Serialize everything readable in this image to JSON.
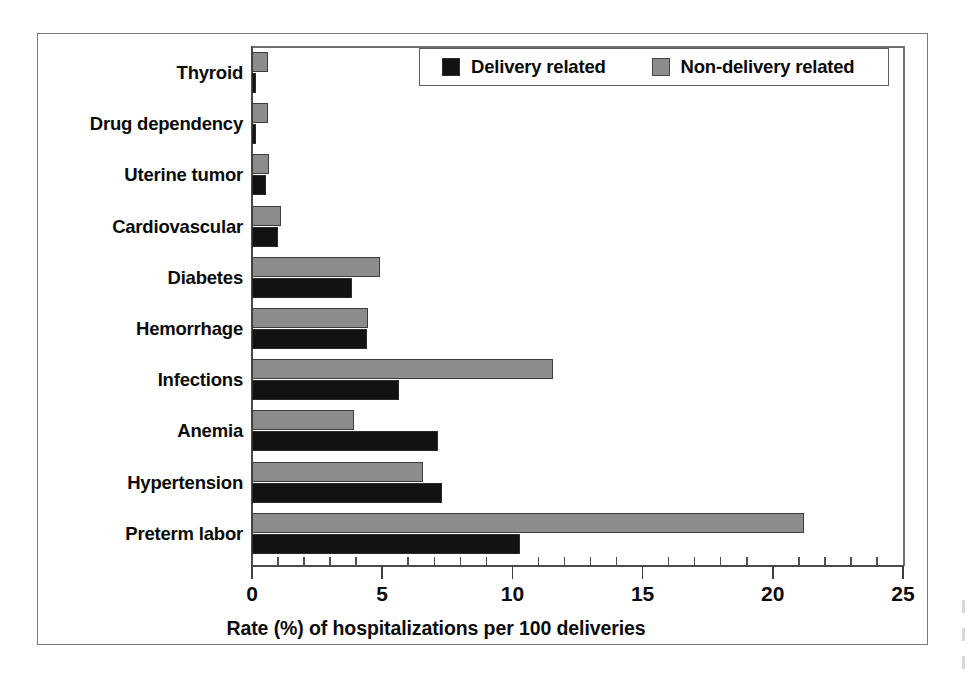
{
  "figure": {
    "title": "",
    "axis_label_x": "Rate (%) of hospitalizations per 100 deliveries"
  },
  "legend": {
    "items": [
      {
        "label": "Delivery related",
        "color": "#121212",
        "key": "delivery"
      },
      {
        "label": "Non-delivery related",
        "color": "#8c8c8c",
        "key": "non_delivery"
      }
    ]
  },
  "axis": {
    "x_ticks_major": [
      "0",
      "5",
      "10",
      "15",
      "20",
      "25"
    ],
    "x_min": 0,
    "x_max": 25,
    "x_minor_step": 1
  },
  "chart_data": {
    "type": "bar",
    "orientation": "horizontal",
    "title": "",
    "xlabel": "Rate (%) of hospitalizations per 100 deliveries",
    "ylabel": "",
    "xlim": [
      0,
      25
    ],
    "grid": false,
    "legend_position": "top-right-inside",
    "categories": [
      "Thyroid",
      "Drug dependency",
      "Uterine tumor",
      "Cardiovascular",
      "Diabetes",
      "Hemorrhage",
      "Infections",
      "Anemia",
      "Hypertension",
      "Preterm labor"
    ],
    "series": [
      {
        "name": "Delivery related",
        "color": "#121212",
        "values": [
          0.15,
          0.15,
          0.55,
          1.0,
          3.85,
          4.4,
          5.65,
          7.15,
          7.3,
          10.3
        ]
      },
      {
        "name": "Non-delivery related",
        "color": "#8c8c8c",
        "values": [
          0.6,
          0.6,
          0.65,
          1.1,
          4.9,
          4.45,
          11.55,
          3.9,
          6.55,
          21.2
        ]
      }
    ]
  }
}
